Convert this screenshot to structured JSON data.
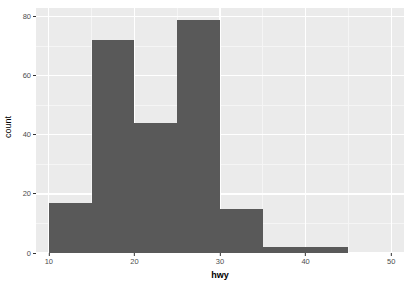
{
  "chart_data": {
    "type": "bar",
    "chart_subtype": "histogram",
    "title": "",
    "subtitle": "",
    "xlabel": "hwy",
    "ylabel": "count",
    "xlim": [
      8.5,
      51.5
    ],
    "ylim": [
      0,
      83
    ],
    "binwidth": 5,
    "grid": true,
    "legend": null,
    "categories": [
      "10-15",
      "15-20",
      "20-25",
      "25-30",
      "30-35",
      "35-40",
      "40-45"
    ],
    "bin_edges": [
      10,
      15,
      20,
      25,
      30,
      35,
      40,
      45
    ],
    "bin_centers": [
      12.5,
      17.5,
      22.5,
      27.5,
      32.5,
      37.5,
      42.5
    ],
    "values": [
      17,
      72,
      44,
      79,
      15,
      2,
      2
    ],
    "bars": [
      {
        "x0": 10,
        "x1": 15,
        "count": 17
      },
      {
        "x0": 15,
        "x1": 20,
        "count": 72
      },
      {
        "x0": 20,
        "x1": 25,
        "count": 44
      },
      {
        "x0": 25,
        "x1": 30,
        "count": 79
      },
      {
        "x0": 30,
        "x1": 35,
        "count": 15
      },
      {
        "x0": 35,
        "x1": 40,
        "count": 2
      },
      {
        "x0": 40,
        "x1": 45,
        "count": 2
      }
    ],
    "x_ticks": [
      {
        "value": 10,
        "label": "10"
      },
      {
        "value": 20,
        "label": "20"
      },
      {
        "value": 30,
        "label": "30"
      },
      {
        "value": 40,
        "label": "40"
      },
      {
        "value": 50,
        "label": "50"
      }
    ],
    "x_minor_ticks": [
      15,
      25,
      35,
      45
    ],
    "y_ticks": [
      {
        "value": 0,
        "label": "0"
      },
      {
        "value": 20,
        "label": "20"
      },
      {
        "value": 40,
        "label": "40"
      },
      {
        "value": 60,
        "label": "60"
      },
      {
        "value": 80,
        "label": "80"
      }
    ],
    "y_minor_ticks": [
      10,
      30,
      50,
      70
    ],
    "colors": {
      "bar_fill": "#595959",
      "panel_background": "#EBEBEB",
      "grid_major": "#FFFFFF",
      "grid_minor": "#F5F5F5",
      "axis_text": "#4D4D4D",
      "axis_title": "#000000",
      "plot_background": "#FFFFFF"
    }
  },
  "axes": {
    "y_title": "count",
    "x_title": "hwy"
  }
}
